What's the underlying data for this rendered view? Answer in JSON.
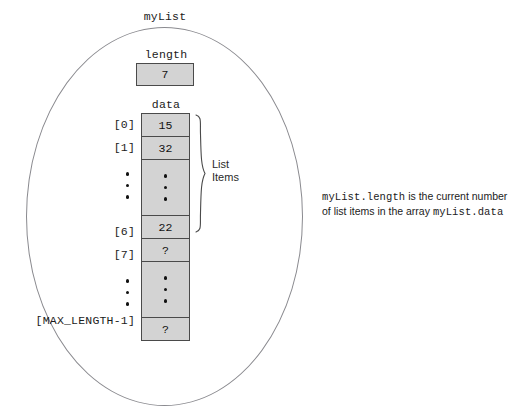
{
  "diagram": {
    "title": "myList",
    "length_field": {
      "label": "length",
      "value": "7"
    },
    "data_field": {
      "label": "data"
    },
    "brace_label_line1": "List",
    "brace_label_line2": "Items",
    "rows": [
      {
        "index": "[0]",
        "value": "15",
        "kind": "value"
      },
      {
        "index": "[1]",
        "value": "32",
        "kind": "value"
      },
      {
        "index": "",
        "value": "",
        "kind": "dots"
      },
      {
        "index": "[6]",
        "value": "22",
        "kind": "value"
      },
      {
        "index": "[7]",
        "value": "?",
        "kind": "value"
      },
      {
        "index": "",
        "value": "",
        "kind": "dots"
      },
      {
        "index": "[MAX_LENGTH-1]",
        "value": "?",
        "kind": "value"
      }
    ],
    "caption": {
      "code1": "myList.length",
      "text1": "is the current number",
      "text2": "of list items in the array",
      "code2": "myList.data"
    },
    "colors": {
      "cell_fill": "#d3d3d3",
      "cell_border": "#4a4a4a",
      "ellipse_stroke": "#8a8a8f",
      "text": "#1b1b1b"
    }
  }
}
